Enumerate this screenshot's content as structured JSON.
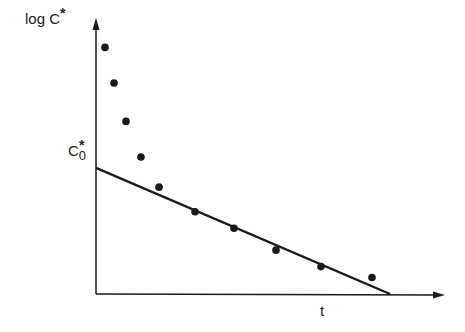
{
  "chart_data": {
    "type": "scatter",
    "title": "",
    "xlabel": "t",
    "ylabel": "log C*",
    "y_marker_label": "C0*",
    "grid": false,
    "legend": null,
    "axis_ranges": {
      "x": [
        0,
        1
      ],
      "y": [
        0,
        1
      ]
    },
    "series": [
      {
        "name": "data points",
        "style": "filled-circle",
        "points": [
          {
            "x": 0.03,
            "y": 0.9
          },
          {
            "x": 0.06,
            "y": 0.77
          },
          {
            "x": 0.1,
            "y": 0.63
          },
          {
            "x": 0.15,
            "y": 0.5
          },
          {
            "x": 0.21,
            "y": 0.39
          },
          {
            "x": 0.33,
            "y": 0.3
          },
          {
            "x": 0.46,
            "y": 0.24
          },
          {
            "x": 0.6,
            "y": 0.16
          },
          {
            "x": 0.75,
            "y": 0.1
          },
          {
            "x": 0.92,
            "y": 0.06
          }
        ]
      },
      {
        "name": "terminal linear fit",
        "style": "line",
        "points": [
          {
            "x": 0.0,
            "y": 0.46
          },
          {
            "x": 0.98,
            "y": 0.0
          }
        ]
      }
    ],
    "annotations": [
      {
        "text": "log C*",
        "position": "y-axis top"
      },
      {
        "text": "C0*",
        "position": "y-intercept of fitted line"
      },
      {
        "text": "t",
        "position": "x-axis"
      }
    ]
  },
  "labels": {
    "ylabel_text": "log  C",
    "ylabel_star": "*",
    "c0_base": "C",
    "c0_sub": "0",
    "c0_star": "*",
    "xlabel": "t"
  },
  "colors": {
    "ink": "#1a1a1a",
    "background": "#ffffff"
  }
}
